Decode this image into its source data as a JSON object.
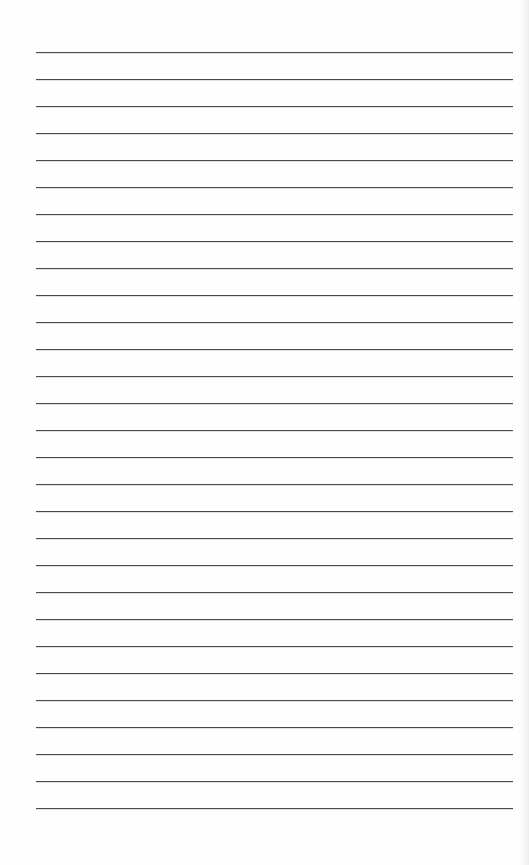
{
  "page": {
    "type": "blank lined paper",
    "background_color": "#fefefe",
    "line_color": "#4a4a4a",
    "line_count": 29,
    "first_line_y": 52,
    "line_spacing": 27,
    "line_left": 36,
    "line_width": 477
  }
}
